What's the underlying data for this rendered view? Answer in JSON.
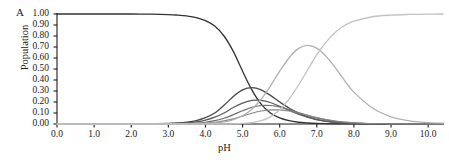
{
  "figure": {
    "panel_label": "A",
    "background_color": "#ffffff"
  },
  "chart_data": {
    "type": "line",
    "title": "",
    "subtitle": "",
    "panel_label": "A",
    "xlabel": "pH",
    "ylabel": "Population",
    "xlim": [
      0.0,
      10.4
    ],
    "ylim": [
      0.0,
      1.0
    ],
    "grid": false,
    "legend": "none",
    "x_ticks": [
      "0.0",
      "1.0",
      "2.0",
      "3.0",
      "4.0",
      "5.0",
      "6.0",
      "7.0",
      "8.0",
      "9.0",
      "10.0"
    ],
    "x_tick_values": [
      0.0,
      1.0,
      2.0,
      3.0,
      4.0,
      5.0,
      6.0,
      7.0,
      8.0,
      9.0,
      10.0
    ],
    "y_ticks": [
      "0.00",
      "0.10",
      "0.20",
      "0.30",
      "0.40",
      "0.50",
      "0.60",
      "0.70",
      "0.80",
      "0.90",
      "1.00"
    ],
    "y_tick_values": [
      0.0,
      0.1,
      0.2,
      0.3,
      0.4,
      0.5,
      0.6,
      0.7,
      0.8,
      0.9,
      1.0
    ],
    "x": [
      0.0,
      0.5,
      1.0,
      1.5,
      2.0,
      2.5,
      3.0,
      3.25,
      3.5,
      3.75,
      4.0,
      4.25,
      4.5,
      4.75,
      5.0,
      5.25,
      5.5,
      5.75,
      6.0,
      6.25,
      6.5,
      6.75,
      7.0,
      7.25,
      7.5,
      7.75,
      8.0,
      8.5,
      9.0,
      9.5,
      10.0,
      10.4
    ],
    "series": [
      {
        "name": "fully-protonated",
        "color": "#333333",
        "width": 1.3,
        "values": [
          1.0,
          1.0,
          1.0,
          1.0,
          1.0,
          0.999,
          0.995,
          0.99,
          0.982,
          0.968,
          0.94,
          0.89,
          0.8,
          0.66,
          0.48,
          0.31,
          0.18,
          0.1,
          0.055,
          0.03,
          0.016,
          0.009,
          0.005,
          0.003,
          0.002,
          0.001,
          0.001,
          0.0,
          0.0,
          0.0,
          0.0,
          0.0
        ]
      },
      {
        "name": "mono-deprotonated-major",
        "color": "#4a4a4a",
        "width": 1.3,
        "values": [
          0.0,
          0.0,
          0.0,
          0.0,
          0.001,
          0.002,
          0.005,
          0.009,
          0.017,
          0.031,
          0.058,
          0.1,
          0.17,
          0.25,
          0.31,
          0.33,
          0.31,
          0.26,
          0.2,
          0.145,
          0.1,
          0.065,
          0.04,
          0.025,
          0.015,
          0.009,
          0.005,
          0.002,
          0.001,
          0.0,
          0.0,
          0.0
        ]
      },
      {
        "name": "mono-deprotonated-minor-1",
        "color": "#5a5a5a",
        "width": 1.2,
        "values": [
          0.0,
          0.0,
          0.0,
          0.0,
          0.0,
          0.001,
          0.003,
          0.005,
          0.01,
          0.019,
          0.035,
          0.062,
          0.1,
          0.15,
          0.19,
          0.215,
          0.215,
          0.195,
          0.16,
          0.125,
          0.09,
          0.062,
          0.04,
          0.025,
          0.015,
          0.009,
          0.005,
          0.002,
          0.001,
          0.0,
          0.0,
          0.0
        ]
      },
      {
        "name": "mono-deprotonated-minor-2",
        "color": "#6e6e6e",
        "width": 1.2,
        "values": [
          0.0,
          0.0,
          0.0,
          0.0,
          0.0,
          0.0,
          0.001,
          0.002,
          0.004,
          0.008,
          0.016,
          0.03,
          0.052,
          0.085,
          0.12,
          0.152,
          0.168,
          0.168,
          0.155,
          0.132,
          0.105,
          0.078,
          0.055,
          0.037,
          0.024,
          0.015,
          0.009,
          0.004,
          0.001,
          0.0,
          0.0,
          0.0
        ]
      },
      {
        "name": "mono-deprotonated-minor-3",
        "color": "#858585",
        "width": 1.2,
        "values": [
          0.0,
          0.0,
          0.0,
          0.0,
          0.0,
          0.0,
          0.0,
          0.001,
          0.002,
          0.004,
          0.008,
          0.015,
          0.028,
          0.047,
          0.072,
          0.098,
          0.118,
          0.128,
          0.128,
          0.118,
          0.1,
          0.079,
          0.058,
          0.041,
          0.027,
          0.017,
          0.011,
          0.004,
          0.002,
          0.001,
          0.0,
          0.0
        ]
      },
      {
        "name": "di-deprotonated",
        "color": "#b0b0b0",
        "width": 1.3,
        "values": [
          0.0,
          0.0,
          0.0,
          0.0,
          0.0,
          0.0,
          0.0,
          0.0,
          0.001,
          0.002,
          0.004,
          0.009,
          0.019,
          0.039,
          0.075,
          0.135,
          0.225,
          0.345,
          0.48,
          0.6,
          0.685,
          0.715,
          0.69,
          0.615,
          0.51,
          0.395,
          0.29,
          0.145,
          0.065,
          0.028,
          0.012,
          0.007
        ]
      },
      {
        "name": "fully-deprotonated",
        "color": "#c2c2c2",
        "width": 1.3,
        "values": [
          0.0,
          0.0,
          0.0,
          0.0,
          0.0,
          0.0,
          0.0,
          0.0,
          0.0,
          0.0,
          0.0,
          0.0,
          0.0,
          0.002,
          0.005,
          0.012,
          0.03,
          0.065,
          0.13,
          0.225,
          0.35,
          0.49,
          0.63,
          0.745,
          0.835,
          0.895,
          0.935,
          0.975,
          0.99,
          0.996,
          0.999,
          1.0
        ]
      }
    ]
  },
  "axes": {
    "x_label": "pH",
    "y_label": "Population",
    "axis_color": "#1a1a1a"
  }
}
